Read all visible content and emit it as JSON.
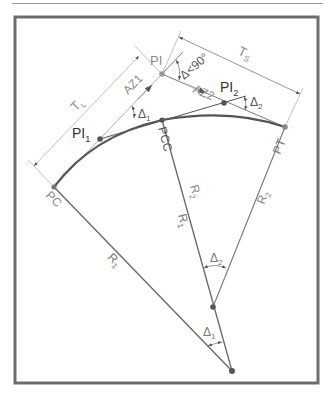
{
  "diagram": {
    "colors": {
      "frame": "#6e6e6e",
      "curve": "#555555",
      "line": "#7a7a7a",
      "light_line": "#b0b0b0",
      "label_dark": "#333333",
      "label_light": "#8a8a8a",
      "point": "#666666"
    },
    "points": {
      "PC": {
        "label": "PC",
        "x": 54,
        "y": 187
      },
      "PI": {
        "label": "PI",
        "x": 162,
        "y": 74
      },
      "PI1": {
        "label": "PI",
        "sub": "1",
        "x": 100,
        "y": 139
      },
      "PI2": {
        "label": "PI",
        "sub": "2",
        "x": 224,
        "y": 103
      },
      "PCC": {
        "label": "PCC",
        "x": 162,
        "y": 120
      },
      "PT": {
        "label": "PT",
        "x": 285,
        "y": 127
      },
      "O2": {
        "x": 213,
        "y": 307
      },
      "O1": {
        "x": 232,
        "y": 371
      }
    },
    "labels": {
      "TL": {
        "main": "T",
        "sub": "L"
      },
      "TS": {
        "main": "T",
        "sub": "S"
      },
      "AZ1": "AZ1",
      "AZ2": "AZ2",
      "delta": "Δ<90°",
      "delta1": {
        "main": "Δ",
        "sub": "1"
      },
      "delta2": {
        "main": "Δ",
        "sub": "2"
      },
      "R1": {
        "main": "R",
        "sub": "1"
      },
      "R2": {
        "main": "R",
        "sub": "2"
      }
    }
  }
}
